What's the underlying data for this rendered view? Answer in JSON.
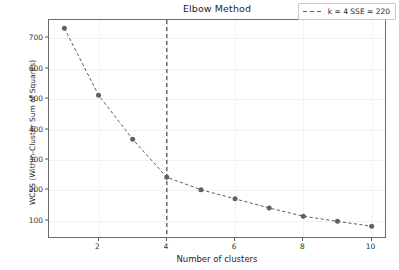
{
  "chart_data": {
    "type": "line",
    "title": "Elbow Method",
    "xlabel": "Number of clusters",
    "ylabel": "WCSS (Within-Cluster Sum of Squares)",
    "x": [
      1,
      2,
      3,
      4,
      5,
      6,
      7,
      8,
      9,
      10
    ],
    "values": [
      733,
      513,
      368,
      243,
      202,
      172,
      142,
      115,
      98,
      82
    ],
    "series": [
      {
        "name": "WCSS",
        "values": [
          733,
          513,
          368,
          243,
          202,
          172,
          142,
          115,
          98,
          82
        ]
      }
    ],
    "xlim": [
      0.55,
      10.45
    ],
    "ylim": [
      40,
      760
    ],
    "xticks": [
      2,
      4,
      6,
      8,
      10
    ],
    "xtick_labels": [
      "2",
      "4",
      "6",
      "8",
      "10"
    ],
    "yticks": [
      100,
      200,
      300,
      400,
      500,
      600,
      700
    ],
    "ytick_labels": [
      "100",
      "200",
      "300",
      "400",
      "500",
      "600",
      "700"
    ],
    "grid": true,
    "legend_position": "upper right",
    "annotations": {
      "elbow_k": 4,
      "elbow_sse": 220,
      "vline_x": 4
    },
    "colors": {
      "line": "#555f63",
      "marker": "#5a6367",
      "vline": "#55595c",
      "grid": "#f2f2f4",
      "frame": "#6b6b6b",
      "background": "#ffffff"
    }
  },
  "legend": {
    "entries": [
      {
        "label": "k = 4  SSE = 220",
        "style": "dashed"
      }
    ]
  }
}
